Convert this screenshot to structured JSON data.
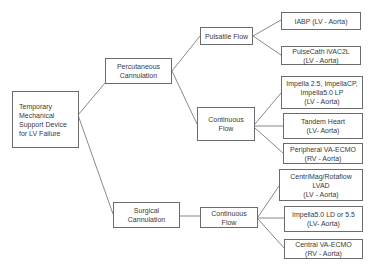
{
  "diagram": {
    "type": "tree",
    "root": {
      "label": "Temporary\nMechanical\nSupport Device\nfor LV Failure"
    },
    "branches": [
      {
        "label": "Percutaneous\nCannulation",
        "children": [
          {
            "label": "Pulsatile Flow",
            "leaves": [
              {
                "label": "IABP (LV - Aorta)"
              },
              {
                "label": "PulseCath iVAC2L\n(LV - Aorta)"
              }
            ]
          },
          {
            "label": "Continuous Flow",
            "leaves": [
              {
                "label": "Impella 2.5, ImpellaCP,\nImpella5.0 LP\n(LV - Aorta)"
              },
              {
                "label": "Tandem Heart\n(LV- Aorta)"
              },
              {
                "label": "Peripheral VA-ECMO\n(RV - Aorta)"
              }
            ]
          }
        ]
      },
      {
        "label": "Surgical\nCannulation",
        "children": [
          {
            "label": "Continuous Flow",
            "leaves": [
              {
                "label": "CentriMag/Rotaflow\nLVAD\n(LV - Aorta)"
              },
              {
                "label": "Impella5.0 LD or 5.5\n(LV- Aorta)"
              },
              {
                "label": "Central VA-ECMO\n(RV - Aorta)"
              }
            ]
          }
        ]
      }
    ]
  },
  "colors": {
    "line": "#6b6b6b",
    "text": "#3a3a3a",
    "background": "#ffffff"
  }
}
